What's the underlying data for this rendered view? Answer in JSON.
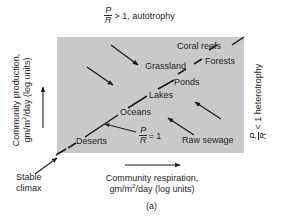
{
  "figure": {
    "caption": "(a)",
    "box_color": "#c9c9c9",
    "line_color": "#1a1a1a",
    "top_label": {
      "ratio_num": "P",
      "ratio_den": "R",
      "text": "> 1, autotrophy"
    },
    "right_label": {
      "ratio_num": "P",
      "ratio_den": "R",
      "text": "< 1 heterotrophy"
    },
    "y_axis": {
      "line1": "Community production,",
      "line2_pre": "gm/m",
      "line2_sup": "2",
      "line2_post": "/day (log units)"
    },
    "x_axis": {
      "line1": "Community respiration,",
      "line2_pre": "gm/m",
      "line2_sup": "2",
      "line2_post": "/day (log units)"
    },
    "stable_climax": {
      "line1": "Stable",
      "line2": "climax"
    },
    "pr_equal_label": {
      "ratio_num": "P",
      "ratio_den": "R",
      "text": "= 1"
    },
    "ecosystems": [
      {
        "name": "Coral reefs"
      },
      {
        "name": "Forests"
      },
      {
        "name": "Grassland"
      },
      {
        "name": "Ponds"
      },
      {
        "name": "Lakes"
      },
      {
        "name": "Oceans"
      },
      {
        "name": "Deserts"
      },
      {
        "name": "Raw sewage"
      }
    ]
  }
}
